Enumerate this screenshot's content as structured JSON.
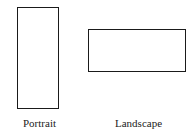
{
  "diagram": {
    "shapes": [
      {
        "id": "portrait",
        "label": "Portrait",
        "orientation": "vertical"
      },
      {
        "id": "landscape",
        "label": "Landscape",
        "orientation": "horizontal"
      }
    ]
  }
}
